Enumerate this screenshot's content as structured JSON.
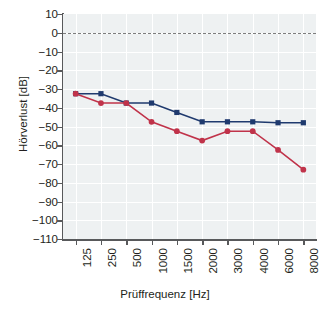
{
  "chart_data": {
    "type": "line",
    "title": "",
    "xlabel": "Prüffrequenz [Hz]",
    "ylabel": "Hörverlust [dB]",
    "categories": [
      "125",
      "250",
      "500",
      "1000",
      "1500",
      "2000",
      "3000",
      "4000",
      "6000",
      "8000"
    ],
    "ylim": [
      -110,
      10
    ],
    "yticks": [
      10,
      0,
      -10,
      -20,
      -30,
      -40,
      -50,
      -60,
      -70,
      -80,
      -90,
      -100,
      -110
    ],
    "ytick_labels": [
      "10",
      "0",
      "−10",
      "−20",
      "−30",
      "−40",
      "−50",
      "−60",
      "−70",
      "−80",
      "−90",
      "−100",
      "−110"
    ],
    "grid": true,
    "legend": "none",
    "reference_line": {
      "value": 0,
      "style": "dashed",
      "color": "#7d7d7d"
    },
    "series": [
      {
        "name": "blue",
        "color": "#1f3a6e",
        "marker": "square",
        "values": [
          -32.5,
          -32.5,
          -37.5,
          -37.5,
          -42.5,
          -47.5,
          -47.5,
          -47.5,
          -48,
          -48
        ]
      },
      {
        "name": "red",
        "color": "#c0334a",
        "marker": "circle",
        "values": [
          -32.5,
          -37.5,
          -37.5,
          -47.5,
          -52.5,
          -57.5,
          -52.5,
          -52.5,
          -62.5,
          -73
        ]
      }
    ]
  }
}
